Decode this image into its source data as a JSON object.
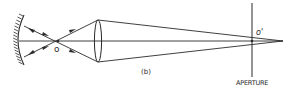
{
  "figure": {
    "caption": "(b)",
    "labels": {
      "object_point": "o",
      "image_point": "o'",
      "aperture": "APERTURE"
    },
    "colors": {
      "stroke": "#2a2a2a",
      "background": "#ffffff"
    },
    "elements": [
      "concave-mirror",
      "optical-axis",
      "crossing-rays",
      "convex-lens",
      "converging-cone",
      "aperture-plane"
    ]
  }
}
